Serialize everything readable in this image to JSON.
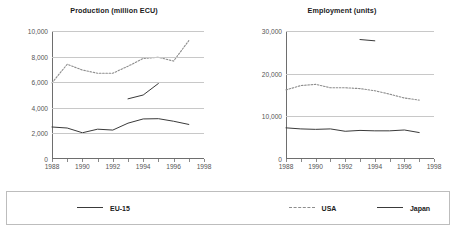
{
  "legend": {
    "entries": [
      {
        "label": "EU-15",
        "style": "solid",
        "color": "#3a3a3a"
      },
      {
        "label": "USA",
        "style": "dotted",
        "color": "#8d8d8d"
      },
      {
        "label": "Japan",
        "style": "solid",
        "color": "#3a3a3a"
      }
    ]
  },
  "chart_data": [
    {
      "type": "line",
      "title": "Production (million ECU)",
      "xlabel": "",
      "ylabel": "",
      "xlim": [
        1988,
        1998
      ],
      "ylim": [
        0,
        10000
      ],
      "yticks": [
        0,
        2000,
        4000,
        6000,
        8000,
        10000
      ],
      "ytick_labels": [
        "0",
        "2,000",
        "4,000",
        "6,000",
        "8,000",
        "10,000"
      ],
      "xticks": [
        1988,
        1989,
        1990,
        1991,
        1992,
        1993,
        1994,
        1995,
        1996,
        1997,
        1998
      ],
      "xtick_labels": [
        "1988",
        "",
        "1990",
        "",
        "1992",
        "",
        "1994",
        "",
        "1996",
        "",
        "1998"
      ],
      "grid": true,
      "legend_position": "bottom-shared",
      "x": [
        1988,
        1989,
        1990,
        1991,
        1992,
        1993,
        1994,
        1995,
        1996,
        1997
      ],
      "series": [
        {
          "name": "EU-15",
          "style": "solid",
          "color": "#3a3a3a",
          "values": [
            2500,
            2420,
            2050,
            2330,
            2260,
            2800,
            3130,
            3150,
            2950,
            2700
          ]
        },
        {
          "name": "USA",
          "style": "dotted",
          "color": "#8d8d8d",
          "values": [
            5950,
            7400,
            6950,
            6700,
            6700,
            7250,
            7850,
            7950,
            7650,
            9250
          ]
        },
        {
          "name": "Japan",
          "style": "solid",
          "color": "#3a3a3a",
          "values": [
            null,
            null,
            null,
            null,
            null,
            4700,
            5000,
            5900,
            null,
            null
          ]
        }
      ]
    },
    {
      "type": "line",
      "title": "Employment (units)",
      "xlabel": "",
      "ylabel": "",
      "xlim": [
        1988,
        1998
      ],
      "ylim": [
        0,
        30000
      ],
      "yticks": [
        0,
        10000,
        20000,
        30000
      ],
      "ytick_labels": [
        "0",
        "10,000",
        "20,000",
        "30,000"
      ],
      "xticks": [
        1988,
        1989,
        1990,
        1991,
        1992,
        1993,
        1994,
        1995,
        1996,
        1997,
        1998
      ],
      "xtick_labels": [
        "1988",
        "",
        "1990",
        "",
        "1992",
        "",
        "1994",
        "",
        "1996",
        "",
        "1998"
      ],
      "grid": true,
      "legend_position": "bottom-shared",
      "x": [
        1988,
        1989,
        1990,
        1991,
        1992,
        1993,
        1994,
        1995,
        1996,
        1997
      ],
      "series": [
        {
          "name": "EU-15",
          "style": "solid",
          "color": "#3a3a3a",
          "values": [
            7300,
            7050,
            6950,
            7050,
            6500,
            6700,
            6600,
            6600,
            6800,
            6200
          ]
        },
        {
          "name": "USA",
          "style": "dotted",
          "color": "#8d8d8d",
          "values": [
            16200,
            17200,
            17500,
            16700,
            16700,
            16500,
            16000,
            15200,
            14300,
            13800
          ]
        },
        {
          "name": "Japan",
          "style": "solid",
          "color": "#3a3a3a",
          "values": [
            null,
            null,
            null,
            null,
            null,
            28000,
            27700,
            null,
            null,
            null
          ]
        }
      ]
    }
  ]
}
